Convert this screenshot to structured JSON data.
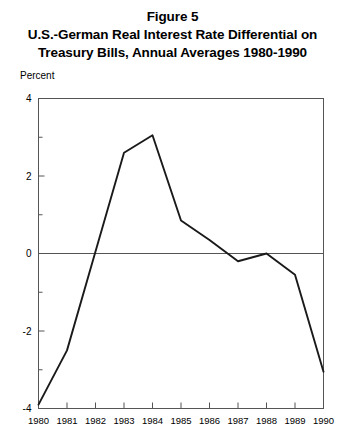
{
  "figure": {
    "title_lines": [
      "Figure 5",
      "U.S.-German Real Interest Rate Differential on",
      "Treasury Bills, Annual Averages 1980-1990"
    ],
    "unit_label": "Percent"
  },
  "chart_data": {
    "type": "line",
    "xlabel": "",
    "ylabel": "Percent",
    "x": [
      1980,
      1981,
      1982,
      1983,
      1984,
      1985,
      1986,
      1987,
      1988,
      1989,
      1990
    ],
    "categories": [
      "1980",
      "1981",
      "1982",
      "1983",
      "1984",
      "1985",
      "1986",
      "1987",
      "1988",
      "1989",
      "1990"
    ],
    "values": [
      -3.9,
      -2.5,
      0.05,
      2.6,
      3.05,
      0.85,
      0.35,
      -0.2,
      0.0,
      -0.55,
      -3.05
    ],
    "series": [
      {
        "name": "U.S.-German real interest rate differential",
        "values": [
          -3.9,
          -2.5,
          0.05,
          2.6,
          3.05,
          0.85,
          0.35,
          -0.2,
          0.0,
          -0.55,
          -3.05
        ]
      }
    ],
    "ylim": [
      -4,
      4
    ],
    "xlim": [
      1980,
      1990
    ],
    "ytick_labels": [
      "4",
      "2",
      "0",
      "-2",
      "-4"
    ],
    "ytick_values": [
      4,
      2,
      0,
      -2,
      -4
    ],
    "yminor_ticks": [
      3,
      1,
      -1,
      -3
    ],
    "xtick_labels": [
      "1980",
      "1981",
      "1982",
      "1983",
      "1984",
      "1985",
      "1986",
      "1987",
      "1988",
      "1989",
      "1990"
    ],
    "grid": false,
    "zero_line": true,
    "legend": false,
    "legend_position": "none",
    "line_color": "#1a1a1a",
    "axis_color": "#555555",
    "background_color": "#ffffff"
  }
}
